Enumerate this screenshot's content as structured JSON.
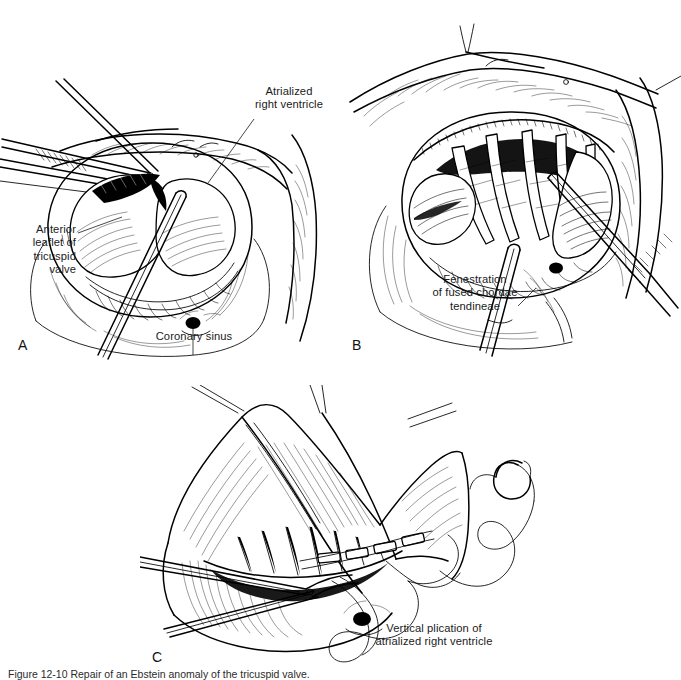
{
  "figure": {
    "type": "surgical-illustration",
    "background_color": "#ffffff",
    "ink_color": "#000000",
    "text_color": "#1a1a1a",
    "caption": "Figure 12-10   Repair of an Ebstein anomaly of the tricuspid valve.",
    "panels": [
      {
        "id": "a",
        "letter": "A",
        "labels": [
          {
            "id": "atrialized-right-ventricle",
            "text": "Atrialized\nright ventricle"
          },
          {
            "id": "anterior-leaflet-of-tricuspid-valve",
            "text": "Anterior\nleaflet of\ntricuspid\nvalve"
          },
          {
            "id": "coronary-sinus",
            "text": "Coronary sinus"
          }
        ]
      },
      {
        "id": "b",
        "letter": "B",
        "labels": [
          {
            "id": "fenestration-of-fused-chordae-tendineae",
            "text": "Fenestration\nof fused chordae\ntendineae"
          }
        ]
      },
      {
        "id": "c",
        "letter": "C",
        "labels": [
          {
            "id": "vertical-plication-of-atrialized-right-ventricle",
            "text": "Vertical plication of\natrialized right ventricle"
          }
        ]
      }
    ]
  },
  "labels": {
    "a_atrialized": "Atrialized\nright ventricle",
    "a_anterior_leaflet": "Anterior\nleaflet of\ntricuspid\nvalve",
    "a_coronary_sinus": "Coronary sinus",
    "b_fenestration": "Fenestration\nof fused chordae\ntendineae",
    "c_vertical_plication": "Vertical plication of\natrialized right ventricle",
    "letter_a": "A",
    "letter_b": "B",
    "letter_c": "C",
    "caption": "Figure 12-10   Repair of an Ebstein anomaly of the tricuspid valve."
  }
}
